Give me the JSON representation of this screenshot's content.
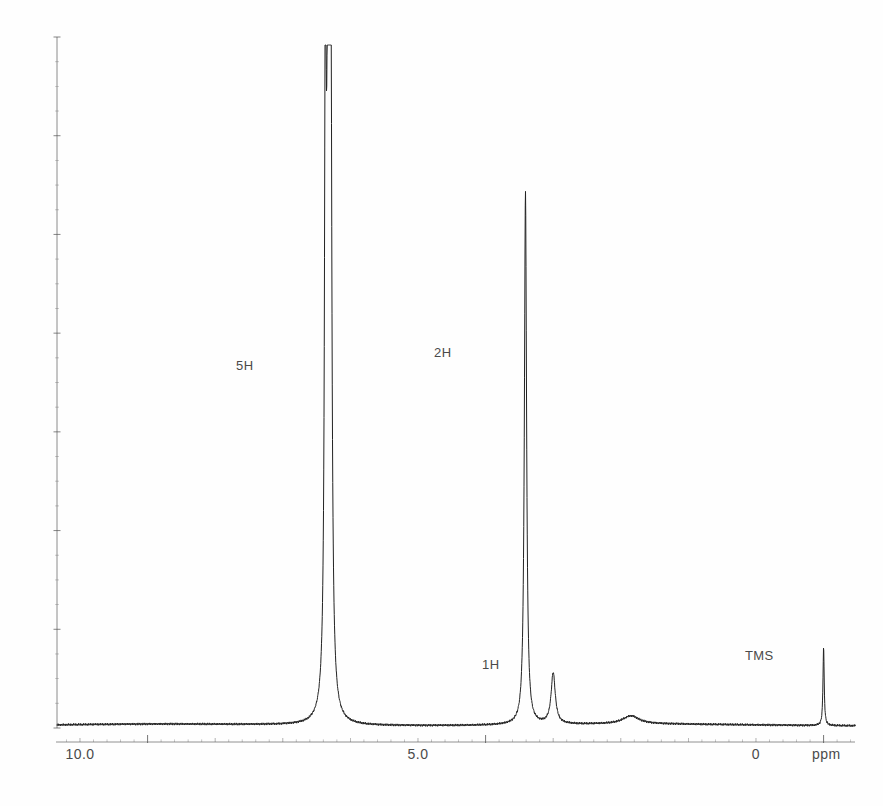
{
  "figure": {
    "kind": "nmr-spectrum",
    "background_color": "#fefefe",
    "trace_color": "#222222",
    "axis_color": "#555555",
    "label_color": "#4a4a4a"
  },
  "annotations": [
    {
      "id": "label-5h",
      "text": "5H",
      "x": 236,
      "y": 358,
      "ppm": 7.35
    },
    {
      "id": "label-2h",
      "text": "2H",
      "x": 434,
      "y": 345,
      "ppm": 4.4
    },
    {
      "id": "label-1h",
      "text": "1H",
      "x": 482,
      "y": 657,
      "ppm": 4.0
    },
    {
      "id": "label-tms",
      "text": "TMS",
      "x": 745,
      "y": 648,
      "ppm": 0.0
    }
  ],
  "axis": {
    "unit": "ppm",
    "unit_x": 812,
    "unit_y": 746,
    "tick_labels": [
      {
        "text": "10.0",
        "x": 80,
        "y": 746,
        "ppm": 10.0
      },
      {
        "text": "5.0",
        "x": 418,
        "y": 746,
        "ppm": 5.0
      },
      {
        "text": "0",
        "x": 756,
        "y": 746,
        "ppm": 0.0
      }
    ],
    "x_left_px": 57,
    "x_right_px": 855,
    "baseline_y_px": 728,
    "tick_axis_y_px": 742,
    "px_per_ppm": 67.6,
    "ppm_at_x0": 11.34,
    "major_ticks_ppm": [
      10.0,
      5.0,
      0.0
    ],
    "minor_tick_step_ppm": 0.2,
    "medium_tick_step_ppm": 1.0
  },
  "vertical_axis": {
    "x_px": 57,
    "top_y_px": 37,
    "bottom_y_px": 728,
    "has_intensity_ticks": true
  },
  "chart_data": {
    "type": "line",
    "title": "",
    "xlabel": "ppm",
    "ylabel": "",
    "xlim": [
      11.34,
      -0.46
    ],
    "ylim": [
      0,
      1
    ],
    "x_axis_reversed": true,
    "grid": false,
    "legend": "none",
    "annotations": [
      "5H",
      "2H",
      "1H",
      "TMS"
    ],
    "peaks": [
      {
        "label": "5H",
        "ppm": 7.33,
        "height_frac": 1.0,
        "width_ppm": 0.045,
        "multiplicity": "multiplet",
        "assignment": "aromatic, 5H"
      },
      {
        "label": "5H",
        "ppm": 7.29,
        "height_frac": 0.97,
        "width_ppm": 0.035,
        "multiplicity": "multiplet",
        "assignment": "aromatic, 5H"
      },
      {
        "label": "5H",
        "ppm": 7.37,
        "height_frac": 0.9,
        "width_ppm": 0.03,
        "multiplicity": "multiplet",
        "assignment": "aromatic, 5H"
      },
      {
        "label": "2H",
        "ppm": 4.41,
        "height_frac": 0.78,
        "width_ppm": 0.04,
        "multiplicity": "singlet",
        "assignment": "CH2, 2H"
      },
      {
        "label": "1H",
        "ppm": 4.0,
        "height_frac": 0.075,
        "width_ppm": 0.075,
        "multiplicity": "multiplet",
        "assignment": "CH / OH, 1H"
      },
      {
        "label": "",
        "ppm": 2.85,
        "height_frac": 0.012,
        "width_ppm": 0.3,
        "multiplicity": "broad",
        "assignment": "broad impurity"
      },
      {
        "label": "TMS",
        "ppm": 0.0,
        "height_frac": 0.115,
        "width_ppm": 0.022,
        "multiplicity": "singlet",
        "assignment": "tetramethylsilane reference"
      }
    ],
    "series": [
      {
        "name": "1H NMR trace",
        "color": "#222222",
        "points_ppm": [
          11.34,
          10.0,
          9.0,
          8.0,
          7.6,
          7.4,
          7.33,
          7.25,
          7.1,
          6.0,
          5.0,
          4.5,
          4.41,
          4.3,
          4.1,
          4.0,
          3.9,
          3.5,
          3.0,
          2.85,
          2.5,
          1.5,
          0.5,
          0.0,
          -0.3,
          -0.46
        ],
        "points_intensity": [
          0.004,
          0.004,
          0.005,
          0.006,
          0.008,
          0.35,
          1.0,
          0.9,
          0.02,
          0.005,
          0.005,
          0.02,
          0.78,
          0.02,
          0.03,
          0.075,
          0.03,
          0.006,
          0.009,
          0.012,
          0.008,
          0.005,
          0.005,
          0.115,
          0.004,
          0.004
        ]
      }
    ]
  }
}
